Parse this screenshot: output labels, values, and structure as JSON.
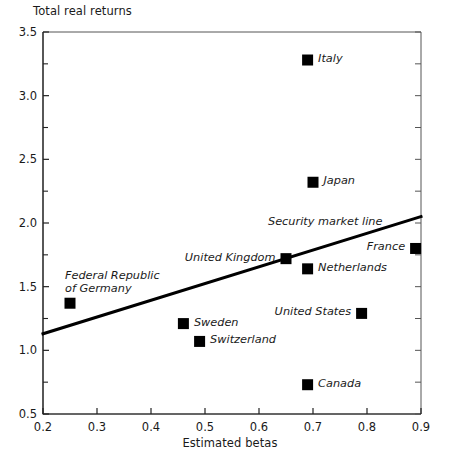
{
  "chart_data": {
    "type": "scatter",
    "title": "",
    "xlabel": "Estimated betas",
    "ylabel": "Total real returns",
    "xlim": [
      0.2,
      0.9
    ],
    "ylim": [
      0.5,
      3.5
    ],
    "xticks": [
      "0.2",
      "0.3",
      "0.4",
      "0.5",
      "0.6",
      "0.7",
      "0.8",
      "0.9"
    ],
    "xtick_values": [
      0.2,
      0.3,
      0.4,
      0.5,
      0.6,
      0.7,
      0.8,
      0.9
    ],
    "yticks": [
      "0.5",
      "1.0",
      "1.5",
      "2.0",
      "2.5",
      "3.0",
      "3.5"
    ],
    "ytick_values": [
      0.5,
      1.0,
      1.5,
      2.0,
      2.5,
      3.0,
      3.5
    ],
    "yminor_values": [
      0.75,
      1.25,
      1.75,
      2.25,
      2.75,
      3.25
    ],
    "grid": false,
    "legend": "none",
    "marker": "filled-square",
    "marker_color": "#000000",
    "points": [
      {
        "label": "Italy",
        "x": 0.69,
        "y": 3.28,
        "label_pos": "right"
      },
      {
        "label": "Japan",
        "x": 0.7,
        "y": 2.32,
        "label_pos": "right"
      },
      {
        "label": "France",
        "x": 0.89,
        "y": 1.8,
        "label_pos": "left"
      },
      {
        "label": "United Kingdom",
        "x": 0.65,
        "y": 1.72,
        "label_pos": "left"
      },
      {
        "label": "Netherlands",
        "x": 0.69,
        "y": 1.64,
        "label_pos": "right"
      },
      {
        "label": "Federal Republic of Germany",
        "x": 0.25,
        "y": 1.37,
        "label_pos": "above"
      },
      {
        "label": "United States",
        "x": 0.79,
        "y": 1.29,
        "label_pos": "left"
      },
      {
        "label": "Sweden",
        "x": 0.46,
        "y": 1.21,
        "label_pos": "right"
      },
      {
        "label": "Switzerland",
        "x": 0.49,
        "y": 1.07,
        "label_pos": "right"
      },
      {
        "label": "Canada",
        "x": 0.69,
        "y": 0.73,
        "label_pos": "right"
      }
    ],
    "annotations": [
      {
        "name": "security-market-line-label",
        "text": "Security market line"
      }
    ],
    "fit_line": {
      "name": "Security market line",
      "x0": 0.2,
      "y0": 1.13,
      "x1": 0.9,
      "y1": 2.05,
      "color": "#000000",
      "width_px": 3
    }
  }
}
